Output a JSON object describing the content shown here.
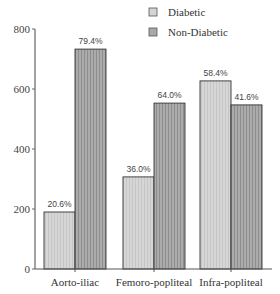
{
  "chart_data": {
    "type": "bar",
    "title": "",
    "xlabel": "",
    "ylabel": "",
    "ylim": [
      0,
      800
    ],
    "yticks": [
      0,
      200,
      400,
      600,
      800
    ],
    "grid": false,
    "legend_position": "top-right",
    "categories": [
      "Aorto-iliac",
      "Femoro-popliteal",
      "Infra-popliteal"
    ],
    "series": [
      {
        "name": "Diabetic",
        "color": "#d4d4d4",
        "values": [
          190,
          307,
          627
        ],
        "labels": [
          "20.6%",
          "36.0%",
          "58.4%"
        ]
      },
      {
        "name": "Non-Diabetic",
        "color": "#a9a9a9",
        "values": [
          733,
          553,
          547
        ],
        "labels": [
          "79.4%",
          "64.0%",
          "41.6%"
        ]
      }
    ]
  },
  "legend": {
    "items": [
      {
        "label": "Diabetic"
      },
      {
        "label": "Non-Diabetic"
      }
    ]
  }
}
